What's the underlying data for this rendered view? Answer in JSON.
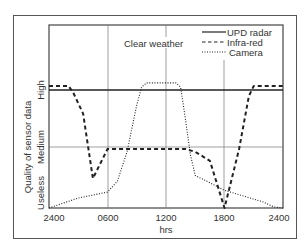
{
  "chart_data": {
    "type": "line",
    "title": "Clear weather",
    "xlabel": "hrs",
    "ylabel": "Quality of sensor data",
    "x_ticks": [
      "2400",
      "0600",
      "1200",
      "1800",
      "2400"
    ],
    "y_ticks": [
      "Useless",
      "Medium",
      "High"
    ],
    "y_levels": {
      "Useless": 0,
      "Medium": 1,
      "High": 2
    },
    "xlim": [
      0,
      24
    ],
    "grid": true,
    "legend_position": "upper right",
    "series": [
      {
        "name": "UPD radar",
        "style": "solid",
        "x": [
          0,
          24
        ],
        "y": [
          2.0,
          2.0
        ]
      },
      {
        "name": "Infra-red",
        "style": "dashed",
        "x": [
          0,
          2.0,
          2.5,
          3.5,
          4.5,
          6.0,
          14.0,
          15.0,
          16.5,
          18.0,
          19.5,
          20.5,
          21.0,
          24.0
        ],
        "y": [
          2.07,
          2.07,
          1.95,
          1.6,
          0.5,
          1.0,
          1.0,
          0.95,
          0.8,
          0.0,
          1.0,
          1.9,
          2.07,
          2.07
        ]
      },
      {
        "name": "Camera",
        "style": "dotted",
        "x": [
          0,
          3.0,
          6.0,
          7.0,
          8.0,
          9.0,
          9.5,
          10.0,
          13.0,
          13.5,
          14.0,
          14.5,
          15.0,
          16.0,
          18.0,
          20.0,
          22.0,
          23.0,
          24.0
        ],
        "y": [
          0.0,
          0.17,
          0.27,
          0.45,
          0.95,
          1.75,
          2.05,
          2.12,
          2.12,
          2.05,
          1.5,
          0.9,
          0.55,
          0.47,
          0.3,
          0.2,
          0.1,
          0.02,
          0.0
        ]
      }
    ]
  },
  "legend": {
    "items": [
      {
        "label": "UPD radar",
        "style": "solid"
      },
      {
        "label": "Infra-red",
        "style": "dashed"
      },
      {
        "label": "Camera",
        "style": "dotted"
      }
    ]
  },
  "annotation": "Clear weather",
  "axes": {
    "xlabel": "hrs",
    "ylabel": "Quality of sensor data",
    "x_ticks": [
      "2400",
      "0600",
      "1200",
      "1800",
      "2400"
    ],
    "y_ticks": [
      "High",
      "Medium",
      "Useless"
    ]
  }
}
